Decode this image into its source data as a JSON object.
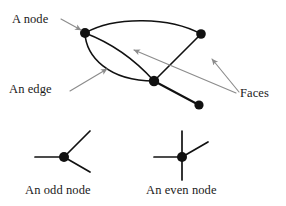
{
  "figure": {
    "background_color": "#ffffff",
    "edge_color": "#111111",
    "node_color": "#111111",
    "annotation_arrow_color": "#8c8c8c",
    "text_color": "#1a1a1a"
  },
  "labels": {
    "a_node": "A node",
    "an_edge": "An edge",
    "faces": "Faces",
    "an_odd_node": "An odd node",
    "an_even_node": "An even node"
  },
  "graph": {
    "nodes": [
      {
        "id": "n1",
        "name": "top-left-node",
        "x": 85,
        "y": 33,
        "r": 5.0,
        "degree": 4
      },
      {
        "id": "n2",
        "name": "top-right-node",
        "x": 201,
        "y": 34,
        "r": 5.0,
        "degree": 2
      },
      {
        "id": "n3",
        "name": "center-node",
        "x": 154,
        "y": 81,
        "r": 5.2,
        "degree": 4
      },
      {
        "id": "n4",
        "name": "bottom-right-node",
        "x": 199,
        "y": 105,
        "r": 4.6,
        "degree": 1
      }
    ],
    "edges": [
      {
        "id": "e1",
        "name": "top-arc-edge",
        "from": "n1",
        "to": "n2",
        "path": "M85,33 C115,16 170,17 201,34"
      },
      {
        "id": "e2",
        "name": "lower-bulge-edge",
        "from": "n1",
        "to": "n3",
        "path": "M85,33 C88,55 110,80 154,81"
      },
      {
        "id": "e3",
        "name": "inner-curve-edge",
        "from": "n1",
        "to": "n3",
        "path": "M85,33 C112,47 134,66 154,81"
      },
      {
        "id": "e4",
        "name": "center-to-top-right-edge",
        "from": "n3",
        "to": "n2",
        "path": "M154,81 L201,34"
      },
      {
        "id": "e5",
        "name": "center-to-bottom-right-edge",
        "from": "n3",
        "to": "n4",
        "path": "M154,81 L199,105"
      },
      {
        "id": "e6",
        "name": "top-left-to-center-straight-edge",
        "from": "n1",
        "to": "n3",
        "path": "M85,33 L154,81"
      }
    ]
  },
  "annotations": [
    {
      "id": "a1",
      "name": "a-node-arrow",
      "path": "M62,20 L82,31",
      "head": [
        82,
        31
      ]
    },
    {
      "id": "a2",
      "name": "an-edge-arrow",
      "path": "M70,90 L106,70",
      "head": [
        106,
        70
      ]
    },
    {
      "id": "a3",
      "name": "faces-arrow-left",
      "path": "M236,92 L133,50",
      "head": [
        133,
        50
      ]
    },
    {
      "id": "a4",
      "name": "faces-arrow-right",
      "path": "M238,92 L211,60",
      "head": [
        211,
        60
      ]
    }
  ],
  "odd_node_diagram": {
    "center": {
      "x": 64,
      "y": 157,
      "r": 5.0
    },
    "spokes": [
      {
        "name": "odd-spoke-left",
        "path": "M64,157 L35,157"
      },
      {
        "name": "odd-spoke-up-right",
        "path": "M64,157 L90,131"
      },
      {
        "name": "odd-spoke-down-right",
        "path": "M64,157 L90,172"
      }
    ],
    "degree": 3
  },
  "even_node_diagram": {
    "center": {
      "x": 182,
      "y": 157,
      "r": 5.0
    },
    "spokes": [
      {
        "name": "even-spoke-left",
        "path": "M182,157 L154,157"
      },
      {
        "name": "even-spoke-up",
        "path": "M182,157 L182,131"
      },
      {
        "name": "even-spoke-down",
        "path": "M182,157 L182,180"
      },
      {
        "name": "even-spoke-up-right",
        "path": "M182,157 L208,142"
      }
    ],
    "degree": 4
  }
}
